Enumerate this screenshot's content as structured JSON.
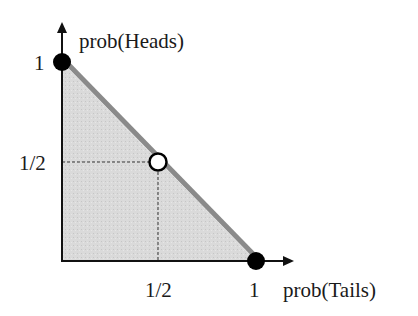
{
  "diagram": {
    "y_axis_label": "prob(Heads)",
    "x_axis_label": "prob(Tails)",
    "y_ticks": [
      "1",
      "1/2"
    ],
    "x_ticks": [
      "1/2",
      "1"
    ],
    "points": [
      {
        "name": "heads-certain",
        "x": 0,
        "y": 1,
        "style": "filled"
      },
      {
        "name": "fair-coin",
        "x": 0.5,
        "y": 0.5,
        "style": "hollow"
      },
      {
        "name": "tails-certain",
        "x": 1,
        "y": 0,
        "style": "filled"
      }
    ],
    "colors": {
      "region_fill": "#d6d6d6",
      "diagonal_line": "#8a8a8a",
      "axis": "#111111",
      "point": "#000000"
    }
  }
}
